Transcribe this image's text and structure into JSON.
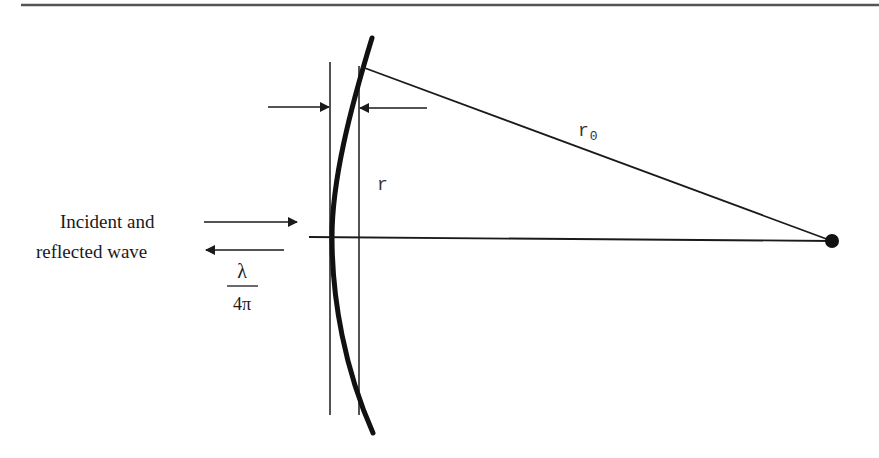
{
  "diagram": {
    "type": "optics-wavefront-schematic",
    "labels": {
      "incident_line1": "Incident and",
      "incident_line2": "reflected wave",
      "r": "r",
      "r0_main": "r",
      "r0_sub": "0",
      "lambda": "λ",
      "four_pi": "4π"
    },
    "elements": [
      "top horizontal rule",
      "curved reflecting surface (thick arc)",
      "left vertical reference line",
      "right vertical reference line",
      "horizontal optical axis",
      "radius line r0 to focal point",
      "focal point dot",
      "thickness arrows (pair, pointing inward)",
      "incident wave arrow (right)",
      "reflected wave arrow (left)",
      "fraction lambda over 4 pi"
    ],
    "colors": {
      "line": "#1a1a1a",
      "rule": "#555555",
      "background": "#ffffff"
    }
  }
}
